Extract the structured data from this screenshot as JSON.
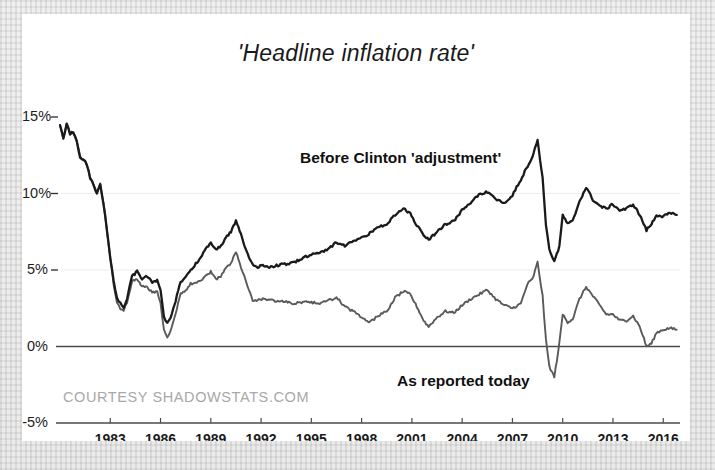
{
  "figure": {
    "title": "'Headline inflation rate'",
    "credit": "COURTESY SHADOWSTATS.COM",
    "annotations": {
      "upper": "Before Clinton 'adjustment'",
      "lower": "As reported today"
    }
  },
  "chart_data": {
    "type": "line",
    "title": "'Headline inflation rate'",
    "xlabel": "",
    "ylabel": "",
    "xlim": [
      1980,
      2017
    ],
    "ylim": [
      -5,
      15
    ],
    "grid": true,
    "grid_lines": [
      5,
      10
    ],
    "zero_line": 0,
    "legend_position": "inline-annotations",
    "xticks": [
      1983,
      1986,
      1989,
      1992,
      1995,
      1998,
      2001,
      2004,
      2007,
      2010,
      2013,
      2016
    ],
    "xtick_labels": [
      "1983",
      "1986",
      "1989",
      "1992",
      "1995",
      "1998",
      "2001",
      "2004",
      "2007",
      "2010",
      "2013",
      "2016"
    ],
    "yticks": [
      -5,
      0,
      5,
      10,
      15
    ],
    "ytick_labels": [
      "-5%",
      "0%",
      "5%",
      "10%",
      "15%"
    ],
    "colors": {
      "upper": "#1a1a1a",
      "lower": "#5a5a5a",
      "axis": "#4a4a4a",
      "grid": "#ececec"
    },
    "series": [
      {
        "name": "Before Clinton 'adjustment'",
        "label": "Before Clinton 'adjustment'",
        "color": "#1a1a1a",
        "x": [
          1980.0,
          1980.2,
          1980.4,
          1980.6,
          1980.8,
          1981.0,
          1981.2,
          1981.4,
          1981.6,
          1981.8,
          1982.0,
          1982.2,
          1982.4,
          1982.6,
          1982.8,
          1983.0,
          1983.2,
          1983.4,
          1983.6,
          1983.8,
          1984.0,
          1984.3,
          1984.6,
          1984.9,
          1985.2,
          1985.5,
          1985.8,
          1986.0,
          1986.2,
          1986.4,
          1986.6,
          1986.9,
          1987.2,
          1987.5,
          1987.8,
          1988.1,
          1988.4,
          1988.7,
          1989.0,
          1989.3,
          1989.6,
          1989.9,
          1990.2,
          1990.5,
          1990.8,
          1991.0,
          1991.2,
          1991.5,
          1991.8,
          1992.1,
          1992.5,
          1993.0,
          1993.5,
          1994.0,
          1994.5,
          1995.0,
          1995.5,
          1996.0,
          1996.5,
          1997.0,
          1997.5,
          1998.0,
          1998.5,
          1999.0,
          1999.5,
          2000.0,
          2000.5,
          2000.9,
          2001.3,
          2001.7,
          2002.0,
          2002.5,
          2003.0,
          2003.5,
          2004.0,
          2004.5,
          2005.0,
          2005.5,
          2006.0,
          2006.5,
          2007.0,
          2007.5,
          2007.9,
          2008.2,
          2008.5,
          2008.8,
          2009.0,
          2009.2,
          2009.5,
          2009.8,
          2010.0,
          2010.3,
          2010.6,
          2011.0,
          2011.4,
          2011.8,
          2012.2,
          2012.6,
          2013.0,
          2013.4,
          2013.8,
          2014.2,
          2014.6,
          2015.0,
          2015.3,
          2015.6,
          2016.0,
          2016.4,
          2016.8
        ],
        "y": [
          14.4,
          13.6,
          14.6,
          13.9,
          14.0,
          13.4,
          12.4,
          12.2,
          11.9,
          11.0,
          10.6,
          10.0,
          10.6,
          9.3,
          7.6,
          5.8,
          4.3,
          3.2,
          2.8,
          2.6,
          3.1,
          4.6,
          4.9,
          4.4,
          4.6,
          4.2,
          4.3,
          3.7,
          2.0,
          1.5,
          1.9,
          3.0,
          4.2,
          4.6,
          5.0,
          5.4,
          5.8,
          6.4,
          6.8,
          6.3,
          6.6,
          7.1,
          7.5,
          8.2,
          7.3,
          6.6,
          6.0,
          5.3,
          5.2,
          5.3,
          5.2,
          5.3,
          5.4,
          5.5,
          5.8,
          6.0,
          6.1,
          6.4,
          6.8,
          6.6,
          6.9,
          7.1,
          7.4,
          7.8,
          8.0,
          8.6,
          9.0,
          8.7,
          7.9,
          7.3,
          7.0,
          7.5,
          8.0,
          8.2,
          8.9,
          9.4,
          9.9,
          10.1,
          9.6,
          9.4,
          9.9,
          10.9,
          11.8,
          12.4,
          13.5,
          11.0,
          8.0,
          6.3,
          5.6,
          6.5,
          8.6,
          8.0,
          8.2,
          9.5,
          10.4,
          9.6,
          9.2,
          9.0,
          9.3,
          8.9,
          9.0,
          9.3,
          8.6,
          7.6,
          8.0,
          8.6,
          8.5,
          8.7,
          8.6
        ]
      },
      {
        "name": "As reported today",
        "label": "As reported today",
        "color": "#5a5a5a",
        "x": [
          1980.0,
          1980.2,
          1980.4,
          1980.6,
          1980.8,
          1981.0,
          1981.2,
          1981.4,
          1981.6,
          1981.8,
          1982.0,
          1982.2,
          1982.4,
          1982.6,
          1982.8,
          1983.0,
          1983.2,
          1983.4,
          1983.6,
          1983.8,
          1984.0,
          1984.3,
          1984.6,
          1984.9,
          1985.2,
          1985.5,
          1985.8,
          1986.0,
          1986.2,
          1986.4,
          1986.6,
          1986.9,
          1987.2,
          1987.5,
          1987.8,
          1988.1,
          1988.4,
          1988.7,
          1989.0,
          1989.3,
          1989.6,
          1989.9,
          1990.2,
          1990.5,
          1990.8,
          1991.0,
          1991.2,
          1991.5,
          1991.8,
          1992.1,
          1992.5,
          1993.0,
          1993.5,
          1994.0,
          1994.5,
          1995.0,
          1995.5,
          1996.0,
          1996.5,
          1997.0,
          1997.5,
          1998.0,
          1998.5,
          1999.0,
          1999.5,
          2000.0,
          2000.5,
          2000.9,
          2001.3,
          2001.7,
          2002.0,
          2002.5,
          2003.0,
          2003.5,
          2004.0,
          2004.5,
          2005.0,
          2005.5,
          2006.0,
          2006.5,
          2007.0,
          2007.5,
          2007.9,
          2008.2,
          2008.5,
          2008.8,
          2009.0,
          2009.2,
          2009.5,
          2009.8,
          2010.0,
          2010.3,
          2010.6,
          2011.0,
          2011.4,
          2011.8,
          2012.2,
          2012.6,
          2013.0,
          2013.4,
          2013.8,
          2014.2,
          2014.6,
          2015.0,
          2015.3,
          2015.6,
          2016.0,
          2016.4,
          2016.8
        ],
        "y": [
          14.4,
          13.6,
          14.6,
          13.9,
          14.0,
          13.4,
          12.4,
          12.2,
          11.9,
          11.0,
          10.6,
          10.0,
          10.6,
          9.3,
          7.6,
          5.8,
          4.1,
          2.9,
          2.5,
          2.4,
          2.9,
          4.3,
          4.4,
          3.9,
          3.9,
          3.5,
          3.6,
          2.9,
          1.1,
          0.6,
          1.0,
          2.2,
          3.4,
          3.7,
          4.1,
          4.2,
          4.3,
          4.6,
          4.9,
          4.4,
          4.6,
          5.2,
          5.4,
          6.2,
          5.2,
          4.6,
          3.9,
          3.0,
          3.0,
          3.1,
          3.0,
          3.0,
          2.9,
          2.8,
          2.9,
          2.9,
          2.8,
          3.0,
          3.2,
          2.6,
          2.3,
          1.9,
          1.6,
          2.0,
          2.3,
          3.2,
          3.6,
          3.4,
          2.6,
          1.7,
          1.3,
          1.9,
          2.3,
          2.2,
          2.7,
          3.1,
          3.4,
          3.7,
          3.1,
          2.7,
          2.5,
          2.8,
          4.1,
          4.4,
          5.5,
          3.3,
          0.4,
          -1.3,
          -2.0,
          0.2,
          2.1,
          1.6,
          1.8,
          3.1,
          3.9,
          3.3,
          2.7,
          2.1,
          2.1,
          1.7,
          1.7,
          2.0,
          1.3,
          0.0,
          0.2,
          0.9,
          1.1,
          1.2,
          1.1
        ]
      }
    ]
  },
  "axes": {
    "y_ticks": [
      {
        "label": "15%",
        "value": 15
      },
      {
        "label": "10%",
        "value": 10
      },
      {
        "label": "5%",
        "value": 5
      },
      {
        "label": "0%",
        "value": 0
      },
      {
        "label": "-5%",
        "value": -5
      }
    ],
    "x_ticks": [
      {
        "label": "1983",
        "value": 1983
      },
      {
        "label": "1986",
        "value": 1986
      },
      {
        "label": "1989",
        "value": 1989
      },
      {
        "label": "1992",
        "value": 1992
      },
      {
        "label": "1995",
        "value": 1995
      },
      {
        "label": "1998",
        "value": 1998
      },
      {
        "label": "2001",
        "value": 2001
      },
      {
        "label": "2004",
        "value": 2004
      },
      {
        "label": "2007",
        "value": 2007
      },
      {
        "label": "2010",
        "value": 2010
      },
      {
        "label": "2013",
        "value": 2013
      },
      {
        "label": "2016",
        "value": 2016
      }
    ]
  }
}
